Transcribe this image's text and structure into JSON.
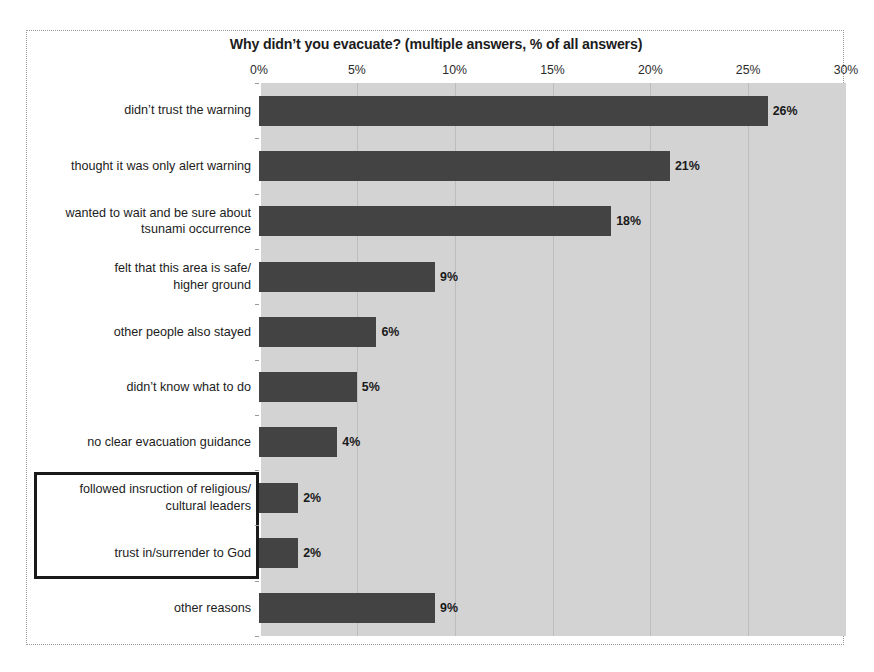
{
  "chart_data": {
    "type": "bar",
    "orientation": "horizontal",
    "title": "Why didn’t you evacuate? (multiple answers, % of all answers)",
    "xlabel": "",
    "ylabel": "",
    "xlim": [
      0,
      30
    ],
    "x_ticks": [
      "0%",
      "5%",
      "10%",
      "15%",
      "20%",
      "25%",
      "30%"
    ],
    "x_tick_values": [
      0,
      5,
      10,
      15,
      20,
      25,
      30
    ],
    "grid": true,
    "legend": null,
    "categories": [
      "didn’t trust the warning",
      "thought it was only alert warning",
      "wanted to wait and be sure about tsunami occurrence",
      "felt that this area is safe/ higher ground",
      "other people also stayed",
      "didn’t know what to do",
      "no clear evacuation guidance",
      "followed insruction of religious/ cultural leaders",
      "trust in/surrender to God",
      "other reasons"
    ],
    "category_lines": [
      [
        "didn’t trust the warning"
      ],
      [
        "thought it was only alert warning"
      ],
      [
        "wanted to wait and be sure about",
        "tsunami occurrence"
      ],
      [
        "felt that this area is safe/",
        "higher ground"
      ],
      [
        "other people also stayed"
      ],
      [
        "didn’t know what to do"
      ],
      [
        "no clear evacuation guidance"
      ],
      [
        "followed insruction of religious/",
        "cultural leaders"
      ],
      [
        "trust in/surrender to God"
      ],
      [
        "other reasons"
      ]
    ],
    "values": [
      26,
      21,
      18,
      9,
      6,
      5,
      4,
      2,
      2,
      9
    ],
    "value_labels": [
      "26%",
      "21%",
      "18%",
      "9%",
      "6%",
      "5%",
      "4%",
      "2%",
      "2%",
      "9%"
    ],
    "colors": {
      "bar": "#434343",
      "plot_background": "#d3d3d3",
      "gridline": "#bdbdbd",
      "figure_background": "#ffffff",
      "text": "#1c1c1c",
      "highlight_border": "#1a1a1a"
    },
    "annotations": [
      {
        "type": "highlight-box",
        "target_categories": [
          "followed insruction of religious/ cultural leaders",
          "trust in/surrender to God"
        ]
      }
    ]
  }
}
